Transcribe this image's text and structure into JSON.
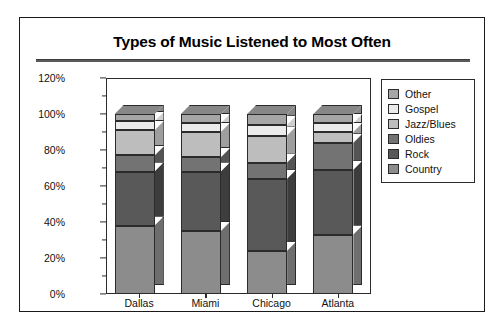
{
  "figure": {
    "title": "Types of Music Listened to Most Often"
  },
  "chart_data": {
    "type": "bar",
    "subtype": "stacked-percent-3d",
    "title": "Types of Music Listened to Most Often",
    "xlabel": "",
    "ylabel": "",
    "categories": [
      "Dallas",
      "Miami",
      "Chicago",
      "Atlanta"
    ],
    "ylim": [
      0,
      120
    ],
    "ytick_labels": [
      "0%",
      "20%",
      "40%",
      "60%",
      "80%",
      "100%",
      "120%"
    ],
    "ytick_values": [
      0,
      20,
      40,
      60,
      80,
      100,
      120
    ],
    "yminor_values": [
      10,
      30,
      50,
      70,
      90,
      110
    ],
    "grid": false,
    "legend_position": "right",
    "stack_order_bottom_to_top": [
      "Country",
      "Rock",
      "Oldies",
      "Jazz/Blues",
      "Gospel",
      "Other"
    ],
    "series": [
      {
        "name": "Country",
        "color": "#8c8c8c",
        "side_color": "#6e6e6e",
        "values": [
          38,
          35,
          24,
          33
        ]
      },
      {
        "name": "Rock",
        "color": "#595959",
        "side_color": "#3d3d3d",
        "values": [
          30,
          33,
          40,
          36
        ]
      },
      {
        "name": "Oldies",
        "color": "#737373",
        "side_color": "#545454",
        "values": [
          9,
          8,
          9,
          15
        ]
      },
      {
        "name": "Jazz/Blues",
        "color": "#bdbdbd",
        "side_color": "#9e9e9e",
        "values": [
          14,
          14,
          15,
          6
        ]
      },
      {
        "name": "Gospel",
        "color": "#ebebeb",
        "side_color": "#cfcfcf",
        "values": [
          5,
          5,
          6,
          5
        ]
      },
      {
        "name": "Other",
        "color": "#a6a6a6",
        "side_color": "#878787",
        "values": [
          4,
          5,
          6,
          5
        ]
      }
    ]
  },
  "legend": {
    "entries": [
      {
        "label": "Other",
        "color": "#a6a6a6"
      },
      {
        "label": "Gospel",
        "color": "#ebebeb"
      },
      {
        "label": "Jazz/Blues",
        "color": "#bdbdbd"
      },
      {
        "label": "Oldies",
        "color": "#737373"
      },
      {
        "label": "Rock",
        "color": "#595959"
      },
      {
        "label": "Country",
        "color": "#8c8c8c"
      }
    ]
  }
}
